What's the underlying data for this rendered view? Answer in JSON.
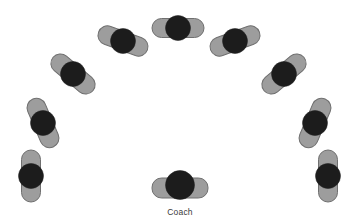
{
  "diagram": {
    "type": "formation-diagram",
    "canvas": {
      "width": 364,
      "height": 223,
      "background": "#ffffff"
    },
    "style": {
      "body_fill": "#9d9d9d",
      "body_stroke": "#6f6f6f",
      "body_stroke_width": 1,
      "head_fill": "#1c1c1c",
      "head_stroke": "#1c1c1c",
      "label_color": "#3a3a3a"
    },
    "figure_geometry": {
      "body_length": 52,
      "body_thickness": 19,
      "body_corner_radius": 9.5,
      "head_radius": 12.5,
      "coach_head_radius": 14.5,
      "coach_body_length": 56,
      "coach_body_thickness": 20
    },
    "people": [
      {
        "id": "player-1",
        "role": "player",
        "label": "",
        "cx": 31,
        "cy": 176,
        "body_angle_deg": 90,
        "head_dx": 0,
        "head_dy": 0
      },
      {
        "id": "player-2",
        "role": "player",
        "label": "",
        "cx": 43,
        "cy": 123,
        "body_angle_deg": 67,
        "head_dx": 0,
        "head_dy": 0
      },
      {
        "id": "player-3",
        "role": "player",
        "label": "",
        "cx": 73,
        "cy": 74,
        "body_angle_deg": 40,
        "head_dx": 0,
        "head_dy": 0
      },
      {
        "id": "player-4",
        "role": "player",
        "label": "",
        "cx": 123,
        "cy": 41,
        "body_angle_deg": 20,
        "head_dx": 0,
        "head_dy": 0
      },
      {
        "id": "player-5",
        "role": "player",
        "label": "",
        "cx": 178,
        "cy": 28,
        "body_angle_deg": 0,
        "head_dx": 0,
        "head_dy": 0
      },
      {
        "id": "player-6",
        "role": "player",
        "label": "",
        "cx": 235,
        "cy": 41,
        "body_angle_deg": -20,
        "head_dx": 0,
        "head_dy": 0
      },
      {
        "id": "player-7",
        "role": "player",
        "label": "",
        "cx": 284,
        "cy": 74,
        "body_angle_deg": -40,
        "head_dx": 0,
        "head_dy": 0
      },
      {
        "id": "player-8",
        "role": "player",
        "label": "",
        "cx": 315,
        "cy": 123,
        "body_angle_deg": -67,
        "head_dx": 0,
        "head_dy": 0
      },
      {
        "id": "player-9",
        "role": "player",
        "label": "",
        "cx": 328,
        "cy": 176,
        "body_angle_deg": 90,
        "head_dx": 0,
        "head_dy": 0
      },
      {
        "id": "coach",
        "role": "coach",
        "label": "Coach",
        "cx": 180,
        "cy": 188,
        "body_angle_deg": 0,
        "head_dx": 0,
        "head_dy": -3
      }
    ],
    "labels": {
      "coach": "Coach"
    }
  }
}
